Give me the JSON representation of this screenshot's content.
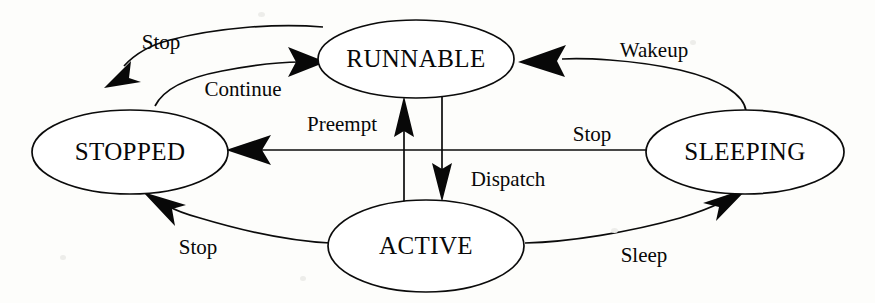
{
  "diagram": {
    "background_color": "#fdfdfb",
    "line_color": "#0b0b0b",
    "states": [
      {
        "id": "runnable",
        "label": "RUNNABLE",
        "cx": 416,
        "cy": 59,
        "rx": 98,
        "ry": 39
      },
      {
        "id": "stopped",
        "label": "STOPPED",
        "cx": 130,
        "cy": 152,
        "rx": 98,
        "ry": 42
      },
      {
        "id": "active",
        "label": "ACTIVE",
        "cx": 426,
        "cy": 246,
        "rx": 98,
        "ry": 46
      },
      {
        "id": "sleeping",
        "label": "SLEEPING",
        "cx": 745,
        "cy": 152,
        "rx": 99,
        "ry": 42
      }
    ],
    "transitions": [
      {
        "id": "stop-runnable-stopped",
        "label": "Stop",
        "from": "RUNNABLE",
        "to": "STOPPED",
        "label_x": 161,
        "label_y": 44
      },
      {
        "id": "continue-stopped-runnable",
        "label": "Continue",
        "from": "STOPPED",
        "to": "RUNNABLE",
        "label_x": 243,
        "label_y": 91
      },
      {
        "id": "wakeup-sleeping-runnable",
        "label": "Wakeup",
        "from": "SLEEPING",
        "to": "RUNNABLE",
        "label_x": 654,
        "label_y": 52
      },
      {
        "id": "preempt-active-runnable",
        "label": "Preempt",
        "from": "ACTIVE",
        "to": "RUNNABLE",
        "label_x": 342,
        "label_y": 126
      },
      {
        "id": "dispatch-runnable-active",
        "label": "Dispatch",
        "from": "RUNNABLE",
        "to": "ACTIVE",
        "label_x": 508,
        "label_y": 181
      },
      {
        "id": "stop-sleeping-stopped",
        "label": "Stop",
        "from": "SLEEPING",
        "to": "STOPPED",
        "label_x": 592,
        "label_y": 136
      },
      {
        "id": "stop-active-stopped",
        "label": "Stop",
        "from": "ACTIVE",
        "to": "STOPPED",
        "label_x": 198,
        "label_y": 249
      },
      {
        "id": "sleep-active-sleeping",
        "label": "Sleep",
        "from": "ACTIVE",
        "to": "SLEEPING",
        "label_x": 644,
        "label_y": 257
      }
    ]
  }
}
